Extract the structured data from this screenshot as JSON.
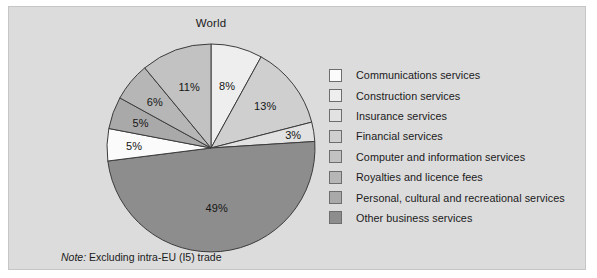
{
  "figure": {
    "title": "World",
    "note_prefix": "Note:",
    "note_text": " Excluding intra-EU (I5) trade"
  },
  "chart_data": {
    "type": "pie",
    "title": "World",
    "xlabel": "",
    "ylabel": "",
    "legend_position": "right",
    "grid": false,
    "start_angle_deg": 0,
    "direction": "clockwise",
    "note": "Note: Excluding intra-EU (I5) trade",
    "value_suffix": "%",
    "categories": [
      "Communications services",
      "Construction services",
      "Insurance services",
      "Financial services",
      "Computer and information services",
      "Royalties and licence fees",
      "Personal, cultural and recreational services",
      "Other business services"
    ],
    "values": [
      5,
      8,
      3,
      13,
      11,
      6,
      5,
      49
    ],
    "colors": [
      "#fbfbfb",
      "#eeeeee",
      "#e2e2e2",
      "#cfcfcf",
      "#c2c2c2",
      "#b6b6b6",
      "#a9a9a9",
      "#8d8d8d"
    ],
    "slice_order_clockwise": [
      {
        "category": "Construction services",
        "value": 8,
        "label": "8%",
        "color": "#eeeeee"
      },
      {
        "category": "Financial services",
        "value": 13,
        "label": "13%",
        "color": "#cfcfcf"
      },
      {
        "category": "Insurance services",
        "value": 3,
        "label": "3%",
        "color": "#e2e2e2"
      },
      {
        "category": "Other business services",
        "value": 49,
        "label": "49%",
        "color": "#8d8d8d"
      },
      {
        "category": "Communications services",
        "value": 5,
        "label": "5%",
        "color": "#fbfbfb"
      },
      {
        "category": "Personal, cultural and recreational services",
        "value": 5,
        "label": "5%",
        "color": "#a9a9a9"
      },
      {
        "category": "Royalties and licence fees",
        "value": 6,
        "label": "6%",
        "color": "#b6b6b6"
      },
      {
        "category": "Computer and information services",
        "value": 11,
        "label": "11%",
        "color": "#c2c2c2"
      }
    ],
    "labels": [
      "8%",
      "13%",
      "3%",
      "49%",
      "5%",
      "5%",
      "6%",
      "11%"
    ]
  },
  "legend": {
    "items": [
      {
        "label": "Communications services",
        "color": "#fbfbfb"
      },
      {
        "label": "Construction services",
        "color": "#eeeeee"
      },
      {
        "label": "Insurance services",
        "color": "#e2e2e2"
      },
      {
        "label": "Financial services",
        "color": "#cfcfcf"
      },
      {
        "label": "Computer and information services",
        "color": "#c2c2c2"
      },
      {
        "label": "Royalties and licence fees",
        "color": "#b6b6b6"
      },
      {
        "label": "Personal, cultural and recreational services",
        "color": "#a9a9a9"
      },
      {
        "label": "Other business services",
        "color": "#8d8d8d"
      }
    ]
  }
}
